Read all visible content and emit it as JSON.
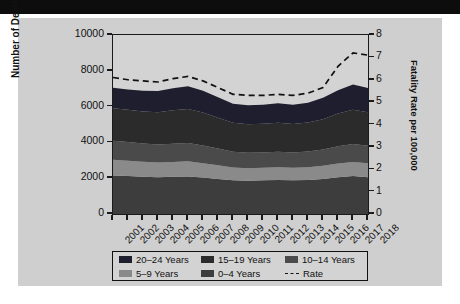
{
  "banner": {
    "text": ""
  },
  "chart_data": {
    "type": "area",
    "title": "",
    "xlabel": "",
    "ylabel": "Number of Deaths",
    "y2label": "Fatality Rate per 100,000",
    "ylim": [
      0,
      10000
    ],
    "y2lim": [
      0,
      8
    ],
    "yticks": [
      "0",
      "2000",
      "4000",
      "6000",
      "8000",
      "10000"
    ],
    "y2ticks": [
      "0",
      "1",
      "2",
      "3",
      "4",
      "5",
      "6",
      "7",
      "8"
    ],
    "grid": false,
    "legend_position": "bottom",
    "categories": [
      "2001",
      "2002",
      "2003",
      "2004",
      "2005",
      "2006",
      "2007",
      "2008",
      "2009",
      "2010",
      "2011",
      "2012",
      "2013",
      "2014",
      "2015",
      "2016",
      "2017",
      "2018"
    ],
    "series": [
      {
        "name": "0-4 Years",
        "label": "0–4 Years",
        "color": "#3d3d3d",
        "values": [
          2150,
          2120,
          2080,
          2060,
          2080,
          2100,
          2040,
          1960,
          1880,
          1860,
          1880,
          1900,
          1880,
          1900,
          1960,
          2060,
          2120,
          2060
        ]
      },
      {
        "name": "5-9 Years",
        "label": "5–9 Years",
        "color": "#8a8a8a",
        "values": [
          880,
          860,
          840,
          820,
          830,
          840,
          800,
          760,
          720,
          700,
          700,
          710,
          700,
          710,
          730,
          760,
          790,
          770
        ]
      },
      {
        "name": "10-14 Years",
        "label": "10–14 Years",
        "color": "#4a4a4a",
        "values": [
          1060,
          1040,
          1020,
          1000,
          1020,
          1030,
          990,
          940,
          880,
          860,
          860,
          870,
          860,
          880,
          910,
          960,
          1000,
          980
        ]
      },
      {
        "name": "15-19 Years",
        "label": "15–19 Years",
        "color": "#2b2b2b",
        "values": [
          1820,
          1800,
          1790,
          1810,
          1860,
          1900,
          1840,
          1720,
          1620,
          1600,
          1600,
          1620,
          1590,
          1620,
          1700,
          1830,
          1920,
          1870
        ]
      },
      {
        "name": "20-24 Years",
        "label": "20–24 Years",
        "color": "#1e1e2e",
        "values": [
          1140,
          1130,
          1150,
          1180,
          1230,
          1260,
          1220,
          1140,
          1060,
          1060,
          1070,
          1090,
          1070,
          1110,
          1190,
          1310,
          1400,
          1360
        ]
      }
    ],
    "totals": [
      7050,
      6950,
      6880,
      6870,
      7020,
      7130,
      6890,
      6520,
      6160,
      6080,
      6110,
      6190,
      6100,
      6220,
      6490,
      6920,
      7230,
      7040
    ],
    "rate_series": {
      "name": "Rate",
      "label": "Rate",
      "style": "dashed",
      "color": "#111111",
      "axis": "right",
      "values": [
        6.1,
        6.0,
        5.95,
        5.9,
        6.05,
        6.15,
        5.95,
        5.65,
        5.35,
        5.3,
        5.3,
        5.35,
        5.3,
        5.4,
        5.65,
        6.6,
        7.2,
        7.1
      ]
    }
  },
  "legend": {
    "entries": [
      {
        "label": "20–24 Years",
        "kind": "swatch",
        "color": "#1e1e2e"
      },
      {
        "label": "15–19 Years",
        "kind": "swatch",
        "color": "#2b2b2b"
      },
      {
        "label": "10–14 Years",
        "kind": "swatch",
        "color": "#4a4a4a"
      },
      {
        "label": "5–9 Years",
        "kind": "swatch",
        "color": "#8a8a8a"
      },
      {
        "label": "0–4 Years",
        "kind": "swatch",
        "color": "#3d3d3d"
      },
      {
        "label": "Rate",
        "kind": "dash",
        "color": "#111111"
      }
    ]
  }
}
